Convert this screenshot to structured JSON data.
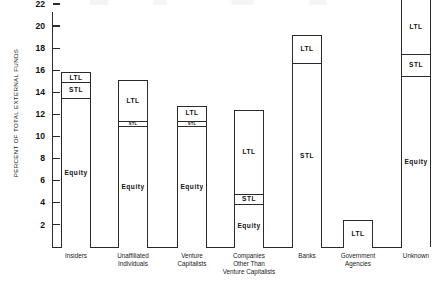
{
  "chart_data": {
    "type": "bar",
    "title": "",
    "subtitle": "",
    "xlabel": "",
    "ylabel": "PERCENT OF TOTAL EXTERNAL FUNDS",
    "ylim": [
      0,
      23
    ],
    "yticks": [
      2,
      4,
      6,
      8,
      10,
      12,
      14,
      16,
      18,
      20,
      22
    ],
    "grid": false,
    "legend": false,
    "stacked": true,
    "segment_order": [
      "Equity",
      "STL",
      "LTL"
    ],
    "categories": [
      "Insiders",
      "Unaffiliated Individuals",
      "Venture Capitalists",
      "Companies Other Than Venture Capitalists",
      "Banks",
      "Government Agencies",
      "Unknown"
    ],
    "category_label_lines": [
      [
        "Insiders"
      ],
      [
        "Unaffiliated",
        "Individuals"
      ],
      [
        "Venture",
        "Capitalists"
      ],
      [
        "Companies",
        "Other Than",
        "Venture Capitalists"
      ],
      [
        "Banks"
      ],
      [
        "Government",
        "Agencies"
      ],
      [
        "Unknown"
      ]
    ],
    "series": [
      {
        "name": "Equity",
        "values": [
          13.6,
          11.0,
          11.0,
          4.0,
          0.0,
          0.0,
          15.6
        ]
      },
      {
        "name": "STL",
        "values": [
          1.4,
          0.5,
          0.5,
          0.9,
          16.7,
          0.0,
          2.0
        ]
      },
      {
        "name": "LTL",
        "values": [
          0.8,
          3.6,
          1.3,
          7.5,
          2.5,
          2.4,
          4.8
        ]
      }
    ],
    "totals": [
      15.8,
      15.1,
      12.8,
      12.4,
      19.2,
      2.4,
      22.4
    ],
    "bars": [
      {
        "category": "Insiders",
        "segments": [
          {
            "label": "Equity",
            "from": 0.0,
            "to": 13.6,
            "value": 13.6,
            "show_label": true
          },
          {
            "label": "STL",
            "from": 13.6,
            "to": 15.0,
            "value": 1.4,
            "show_label": true
          },
          {
            "label": "LTL",
            "from": 15.0,
            "to": 15.8,
            "value": 0.8,
            "show_label": true
          }
        ]
      },
      {
        "category": "Unaffiliated Individuals",
        "segments": [
          {
            "label": "Equity",
            "from": 0.0,
            "to": 11.0,
            "value": 11.0,
            "show_label": true
          },
          {
            "label": "STL",
            "from": 11.0,
            "to": 11.5,
            "value": 0.5,
            "show_label": true
          },
          {
            "label": "LTL",
            "from": 11.5,
            "to": 15.1,
            "value": 3.6,
            "show_label": true
          }
        ]
      },
      {
        "category": "Venture Capitalists",
        "segments": [
          {
            "label": "Equity",
            "from": 0.0,
            "to": 11.0,
            "value": 11.0,
            "show_label": true
          },
          {
            "label": "STL",
            "from": 11.0,
            "to": 11.5,
            "value": 0.5,
            "show_label": true
          },
          {
            "label": "LTL",
            "from": 11.5,
            "to": 12.8,
            "value": 1.3,
            "show_label": true
          }
        ]
      },
      {
        "category": "Companies Other Than Venture Capitalists",
        "segments": [
          {
            "label": "Equity",
            "from": 0.0,
            "to": 4.0,
            "value": 4.0,
            "show_label": true
          },
          {
            "label": "STL",
            "from": 4.0,
            "to": 4.9,
            "value": 0.9,
            "show_label": true
          },
          {
            "label": "LTL",
            "from": 4.9,
            "to": 12.4,
            "value": 7.5,
            "show_label": true
          }
        ]
      },
      {
        "category": "Banks",
        "segments": [
          {
            "label": "STL",
            "from": 0.0,
            "to": 16.7,
            "value": 16.7,
            "show_label": true
          },
          {
            "label": "LTL",
            "from": 16.7,
            "to": 19.2,
            "value": 2.5,
            "show_label": true
          }
        ]
      },
      {
        "category": "Government Agencies",
        "segments": [
          {
            "label": "LTL",
            "from": 0.0,
            "to": 2.4,
            "value": 2.4,
            "show_label": true
          }
        ]
      },
      {
        "category": "Unknown",
        "segments": [
          {
            "label": "Equity",
            "from": 0.0,
            "to": 15.6,
            "value": 15.6,
            "show_label": true
          },
          {
            "label": "STL",
            "from": 15.6,
            "to": 17.6,
            "value": 2.0,
            "show_label": true
          },
          {
            "label": "LTL",
            "from": 17.6,
            "to": 22.4,
            "value": 4.8,
            "show_label": true
          }
        ]
      }
    ],
    "colors": {
      "axis": "#2b2b2b",
      "bar_border": "#2b2b2b",
      "bar_fill": "#ffffff",
      "text": "#1a1a1a"
    }
  }
}
